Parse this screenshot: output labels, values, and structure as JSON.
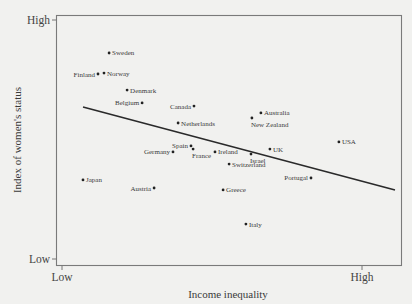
{
  "chart_data": {
    "type": "scatter",
    "title": "",
    "xlabel": "Income inequality",
    "ylabel": "Index of women's status",
    "x_tick_labels": [
      "Low",
      "High"
    ],
    "y_tick_labels": [
      "Low",
      "High"
    ],
    "xlim": [
      -0.2,
      11.3
    ],
    "ylim": [
      -0.25,
      10.2
    ],
    "grid": false,
    "legend": null,
    "scale_note": "Axes unlabeled numerically; values on a relative 0 (Low) to 10 (High) scale estimated from pixel positions",
    "points": [
      {
        "name": "Sweden",
        "x": 1.57,
        "y": 8.62,
        "label_side": "right"
      },
      {
        "name": "Finland",
        "x": 1.2,
        "y": 7.74,
        "label_side": "left"
      },
      {
        "name": "Norway",
        "x": 1.4,
        "y": 7.78,
        "label_side": "right"
      },
      {
        "name": "Denmark",
        "x": 2.17,
        "y": 7.07,
        "label_side": "right"
      },
      {
        "name": "Belgium",
        "x": 2.67,
        "y": 6.53,
        "label_side": "left"
      },
      {
        "name": "Canada",
        "x": 4.4,
        "y": 6.4,
        "label_side": "left"
      },
      {
        "name": "Netherlands",
        "x": 3.87,
        "y": 5.69,
        "label_side": "right"
      },
      {
        "name": "Australia",
        "x": 6.63,
        "y": 6.11,
        "label_side": "right"
      },
      {
        "name": "New Zealand",
        "x": 6.33,
        "y": 5.9,
        "label_side": "below"
      },
      {
        "name": "USA",
        "x": 9.23,
        "y": 4.9,
        "label_side": "right"
      },
      {
        "name": "Spain",
        "x": 4.3,
        "y": 4.73,
        "label_side": "left"
      },
      {
        "name": "France",
        "x": 4.37,
        "y": 4.6,
        "label_side": "below"
      },
      {
        "name": "Germany",
        "x": 3.7,
        "y": 4.48,
        "label_side": "left"
      },
      {
        "name": "Ireland",
        "x": 5.1,
        "y": 4.48,
        "label_side": "right"
      },
      {
        "name": "Israel",
        "x": 6.3,
        "y": 4.39,
        "label_side": "below"
      },
      {
        "name": "UK",
        "x": 6.93,
        "y": 4.6,
        "label_side": "right"
      },
      {
        "name": "Switzerland",
        "x": 5.57,
        "y": 3.97,
        "label_side": "right"
      },
      {
        "name": "Japan",
        "x": 0.7,
        "y": 3.31,
        "label_side": "right"
      },
      {
        "name": "Austria",
        "x": 3.07,
        "y": 2.97,
        "label_side": "left"
      },
      {
        "name": "Greece",
        "x": 5.37,
        "y": 2.89,
        "label_side": "right"
      },
      {
        "name": "Portugal",
        "x": 8.3,
        "y": 3.39,
        "label_side": "left"
      },
      {
        "name": "Italy",
        "x": 6.13,
        "y": 1.46,
        "label_side": "right"
      }
    ],
    "trendline": {
      "type": "linear",
      "x_start": 0.7,
      "y_start": 6.36,
      "x_end": 11.1,
      "y_end": 2.89
    }
  }
}
